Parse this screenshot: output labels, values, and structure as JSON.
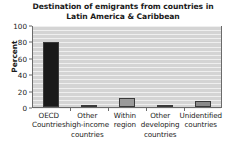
{
  "chart_data": {
    "type": "bar",
    "title": "Destination of emigrants from countries in Latin America & Caribbean",
    "title_line1": "Destination of emigrants from countries in",
    "title_line2": "Latin America & Caribbean",
    "xlabel": "",
    "ylabel": "Percent",
    "ylim": [
      0,
      100
    ],
    "yticks": [
      0,
      20,
      40,
      60,
      80,
      100
    ],
    "ytick_labels": [
      "0",
      "20",
      "40",
      "60",
      "80",
      "100"
    ],
    "grid": "horizontal-white-on-gray",
    "legend": "none",
    "categories": [
      "OECD Countries",
      "Other high-income countries",
      "Within region",
      "Other developing countries",
      "Unidentified countries"
    ],
    "category_lines": [
      [
        "OECD",
        "Countries"
      ],
      [
        "Other",
        "high-income",
        "countries"
      ],
      [
        "Within",
        "region"
      ],
      [
        "Other",
        "developing",
        "countries"
      ],
      [
        "Unidentified",
        "countries"
      ]
    ],
    "values": [
      79,
      1,
      11,
      2,
      7
    ],
    "bar_colors": [
      "#1a1a1a",
      "#8c8c8c",
      "#9a9a9a",
      "#8c8c8c",
      "#8a8a8a"
    ],
    "bar_edge_color": "#3a3a3a",
    "plot_background": "#d4d4d4",
    "gridline_color": "#efefef",
    "axis_color": "#6b6b6b",
    "text_color": "#1a1a1a"
  }
}
